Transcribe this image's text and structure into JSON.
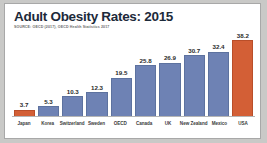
{
  "card": {
    "title": "Adult Obesity Rates: 2015",
    "source": "SOURCE: OECD (2017), OECD Health Statistics 2017"
  },
  "colors": {
    "bar_default": "#6e82b4",
    "bar_accent": "#d35f36",
    "title_text": "#1d2a3a",
    "source_text": "#6d6d6d",
    "card_background": "#ffffff",
    "page_background": "#c9c9c7"
  },
  "chart_data": {
    "type": "bar",
    "title": "Adult Obesity Rates: 2015",
    "subtitle": "SOURCE: OECD (2017), OECD Health Statistics 2017",
    "xlabel": "",
    "ylabel": "",
    "ylim": [
      0,
      38.2
    ],
    "grid": false,
    "legend": "none",
    "orientation": "vertical",
    "categories": [
      "Japan",
      "Korea",
      "Switzerland",
      "Sweden",
      "OECD",
      "Canada",
      "UK",
      "New Zealand",
      "Mexico",
      "USA"
    ],
    "values": [
      3.7,
      5.3,
      10.3,
      12.3,
      19.5,
      25.8,
      26.9,
      30.7,
      32.4,
      38.2
    ],
    "value_labels": [
      "3.7",
      "5.3",
      "10.3",
      "12.3",
      "19.5",
      "25.8",
      "26.9",
      "30.7",
      "32.4",
      "38.2"
    ],
    "bar_colors": [
      "#d35f36",
      "#6e82b4",
      "#6e82b4",
      "#6e82b4",
      "#6e82b4",
      "#6e82b4",
      "#6e82b4",
      "#6e82b4",
      "#6e82b4",
      "#d35f36"
    ],
    "highlighted": [
      "Japan",
      "USA"
    ]
  }
}
